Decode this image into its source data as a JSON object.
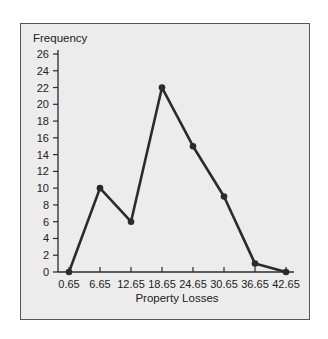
{
  "chart_data": {
    "type": "line",
    "title": "",
    "xlabel": "Property Losses",
    "ylabel": "Frequency",
    "categories": [
      "0.65",
      "6.65",
      "12.65",
      "18.65",
      "24.65",
      "30.65",
      "36.65",
      "42.65"
    ],
    "x": [
      0.65,
      6.65,
      12.65,
      18.65,
      24.65,
      30.65,
      36.65,
      42.65
    ],
    "values": [
      0,
      10,
      6,
      22,
      15,
      9,
      1,
      0
    ],
    "series": [
      {
        "name": "Frequency",
        "values": [
          0,
          10,
          6,
          22,
          15,
          9,
          1,
          0
        ]
      }
    ],
    "yticks": [
      0,
      2,
      4,
      6,
      8,
      10,
      12,
      14,
      16,
      18,
      20,
      22,
      24,
      26
    ],
    "ylim": [
      0,
      26
    ],
    "grid": false,
    "legend": "none",
    "style": {
      "line_color": "#2b2b2b",
      "background": "#ececec",
      "frame_color": "#555555"
    }
  }
}
